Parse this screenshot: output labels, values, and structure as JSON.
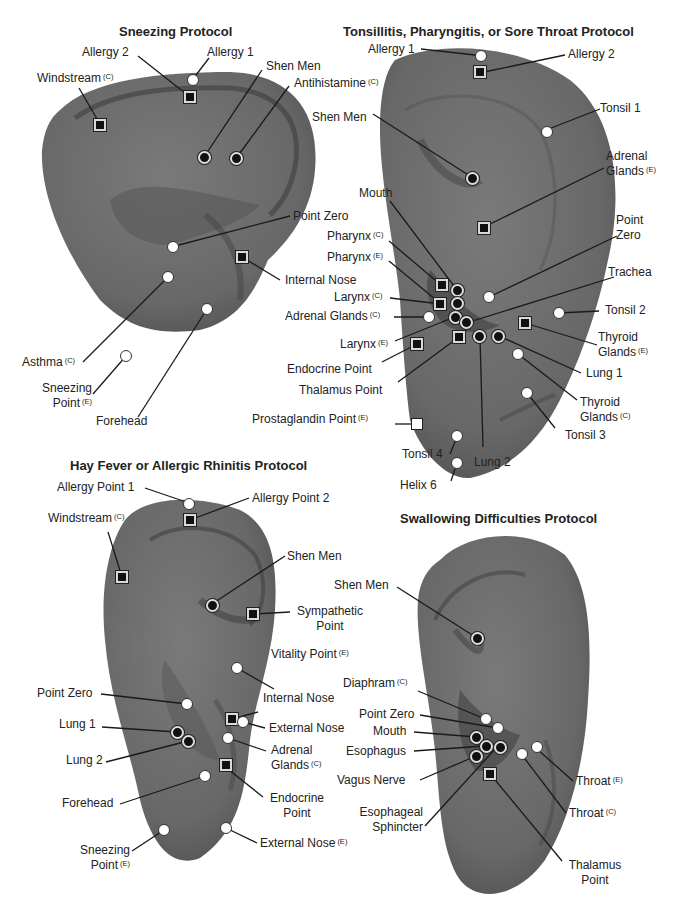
{
  "legend_markers": {
    "circle-white": "auricular point",
    "circle-black": "auricular point (emphasis)",
    "square-black": "auricular point (alternate)",
    "square-white": "auricular point (posterior)"
  },
  "superscripts": {
    "C": "(C)",
    "E": "(E)"
  },
  "colors": {
    "ear_fill": "#6e6e6e",
    "ear_dark": "#4a4a4a",
    "line": "#1a1a1a",
    "text": "#222222"
  },
  "protocols": [
    {
      "title": "Sneezing Protocol",
      "labels": [
        {
          "text": "Allergy 2",
          "sup": ""
        },
        {
          "text": "Allergy 1",
          "sup": ""
        },
        {
          "text": "Windstream",
          "sup": "(C)"
        },
        {
          "text": "Shen Men",
          "sup": ""
        },
        {
          "text": "Antihistamine",
          "sup": "(C)"
        },
        {
          "text": "Point Zero",
          "sup": ""
        },
        {
          "text": "Internal Nose",
          "sup": ""
        },
        {
          "text": "Asthma",
          "sup": "(C)"
        },
        {
          "text": "Sneezing",
          "sup": ""
        },
        {
          "text": "Point",
          "sup": "(E)"
        },
        {
          "text": "Forehead",
          "sup": ""
        }
      ]
    },
    {
      "title": "Tonsillitis, Pharyngitis, or Sore Throat Protocol",
      "labels": [
        {
          "text": "Allergy 1",
          "sup": ""
        },
        {
          "text": "Allergy 2",
          "sup": ""
        },
        {
          "text": "Tonsil 1",
          "sup": ""
        },
        {
          "text": "Shen Men",
          "sup": ""
        },
        {
          "text": "Adrenal",
          "sup": ""
        },
        {
          "text": "Glands",
          "sup": "(E)"
        },
        {
          "text": "Mouth",
          "sup": ""
        },
        {
          "text": "Point",
          "sup": ""
        },
        {
          "text": "Zero",
          "sup": ""
        },
        {
          "text": "Pharynx",
          "sup": "(C)"
        },
        {
          "text": "Pharynx",
          "sup": "(E)"
        },
        {
          "text": "Trachea",
          "sup": ""
        },
        {
          "text": "Larynx",
          "sup": "(C)"
        },
        {
          "text": "Adrenal Glands",
          "sup": "(C)"
        },
        {
          "text": "Tonsil 2",
          "sup": ""
        },
        {
          "text": "Larynx",
          "sup": "(E)"
        },
        {
          "text": "Thyroid",
          "sup": ""
        },
        {
          "text": "Glands",
          "sup": "(E)"
        },
        {
          "text": "Endocrine Point",
          "sup": ""
        },
        {
          "text": "Lung 1",
          "sup": ""
        },
        {
          "text": "Thalamus Point",
          "sup": ""
        },
        {
          "text": "Thyroid",
          "sup": ""
        },
        {
          "text": "Glands",
          "sup": "(C)"
        },
        {
          "text": "Prostaglandin Point",
          "sup": "(E)"
        },
        {
          "text": "Tonsil 3",
          "sup": ""
        },
        {
          "text": "Tonsil 4",
          "sup": ""
        },
        {
          "text": "Lung 2",
          "sup": ""
        },
        {
          "text": "Helix 6",
          "sup": ""
        }
      ]
    },
    {
      "title": "Hay Fever or Allergic Rhinitis Protocol",
      "labels": [
        {
          "text": "Allergy Point 1",
          "sup": ""
        },
        {
          "text": "Allergy Point 2",
          "sup": ""
        },
        {
          "text": "Windstream",
          "sup": "(C)"
        },
        {
          "text": "Shen Men",
          "sup": ""
        },
        {
          "text": "Sympathetic",
          "sup": ""
        },
        {
          "text": "Point",
          "sup": ""
        },
        {
          "text": "Vitality Point",
          "sup": "(E)"
        },
        {
          "text": "Point Zero",
          "sup": ""
        },
        {
          "text": "Internal Nose",
          "sup": ""
        },
        {
          "text": "External Nose",
          "sup": ""
        },
        {
          "text": "Lung 1",
          "sup": ""
        },
        {
          "text": "Lung 2",
          "sup": ""
        },
        {
          "text": "Adrenal",
          "sup": ""
        },
        {
          "text": "Glands",
          "sup": "(C)"
        },
        {
          "text": "Forehead",
          "sup": ""
        },
        {
          "text": "Endocrine",
          "sup": ""
        },
        {
          "text": "Point",
          "sup": ""
        },
        {
          "text": "Sneezing",
          "sup": ""
        },
        {
          "text": "Point",
          "sup": "(E)"
        },
        {
          "text": "External Nose",
          "sup": "(E)"
        }
      ]
    },
    {
      "title": "Swallowing Difficulties Protocol",
      "labels": [
        {
          "text": "Shen Men",
          "sup": ""
        },
        {
          "text": "Diaphram",
          "sup": "(C)"
        },
        {
          "text": "Point Zero",
          "sup": ""
        },
        {
          "text": "Mouth",
          "sup": ""
        },
        {
          "text": "Esophagus",
          "sup": ""
        },
        {
          "text": "Vagus Nerve",
          "sup": ""
        },
        {
          "text": "Throat",
          "sup": "(E)"
        },
        {
          "text": "Esophageal",
          "sup": ""
        },
        {
          "text": "Sphincter",
          "sup": ""
        },
        {
          "text": "Throat",
          "sup": "(C)"
        },
        {
          "text": "Thalamus",
          "sup": ""
        },
        {
          "text": "Point",
          "sup": ""
        }
      ]
    }
  ]
}
